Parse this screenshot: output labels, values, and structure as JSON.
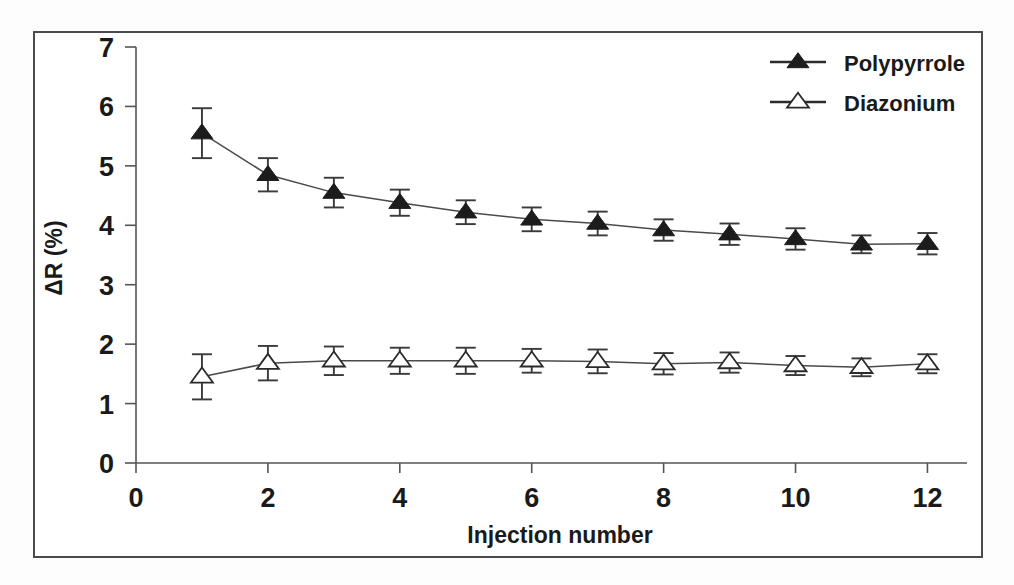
{
  "chart_data": {
    "type": "line",
    "title": "",
    "xlabel": "Injection number",
    "ylabel": "ΔR (%)",
    "xlim": [
      0,
      12.6
    ],
    "ylim": [
      0,
      7
    ],
    "xticks": [
      0,
      2,
      4,
      6,
      8,
      10,
      12
    ],
    "xtick_labels": [
      "0",
      "2",
      "4",
      "6",
      "8",
      "10",
      "12"
    ],
    "yticks": [
      0,
      1,
      2,
      3,
      4,
      5,
      6,
      7
    ],
    "ytick_labels": [
      "0",
      "1",
      "2",
      "3",
      "4",
      "5",
      "6",
      "7"
    ],
    "grid": false,
    "legend_position": "top-right",
    "x": [
      1,
      2,
      3,
      4,
      5,
      6,
      7,
      8,
      9,
      10,
      11,
      12
    ],
    "series": [
      {
        "name": "Polypyrrole",
        "marker": "filled-triangle",
        "values": [
          5.55,
          4.85,
          4.55,
          4.38,
          4.22,
          4.1,
          4.03,
          3.92,
          3.85,
          3.77,
          3.68,
          3.69
        ],
        "errors": [
          0.42,
          0.28,
          0.25,
          0.22,
          0.2,
          0.2,
          0.2,
          0.18,
          0.18,
          0.18,
          0.15,
          0.18
        ]
      },
      {
        "name": "Diazonium",
        "marker": "open-triangle",
        "values": [
          1.45,
          1.68,
          1.72,
          1.72,
          1.72,
          1.72,
          1.71,
          1.67,
          1.69,
          1.64,
          1.61,
          1.67
        ],
        "errors": [
          0.38,
          0.29,
          0.24,
          0.22,
          0.22,
          0.2,
          0.2,
          0.18,
          0.17,
          0.16,
          0.15,
          0.16
        ]
      }
    ]
  },
  "legend": {
    "entries": [
      {
        "label": "Polypyrrole",
        "marker": "filled-triangle"
      },
      {
        "label": "Diazonium",
        "marker": "open-triangle"
      }
    ]
  },
  "colors": {
    "marker_filled": "#1c1c1c",
    "marker_open_fill": "#ffffff",
    "marker_open_stroke": "#2b2b2b",
    "line": "#4a4a4a",
    "axis": "#555555",
    "frame": "#4a4a4a",
    "text": "#1a1a1a",
    "background": "#ffffff"
  }
}
